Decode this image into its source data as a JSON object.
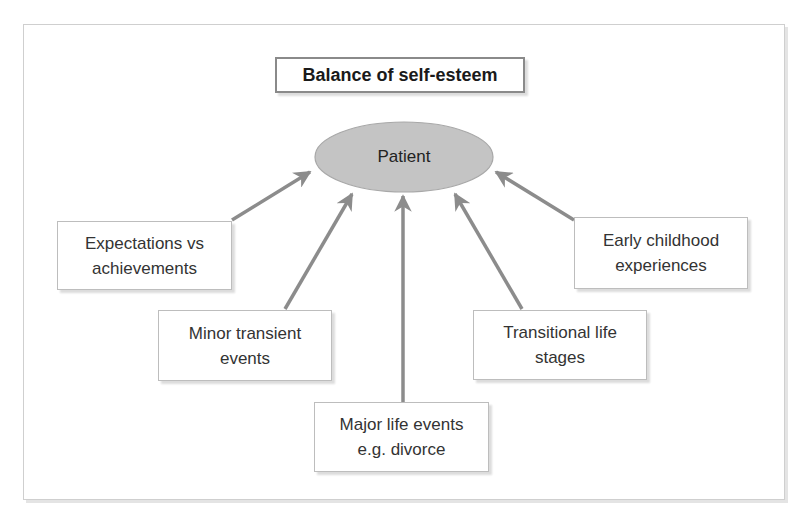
{
  "diagram": {
    "title": "Balance of self-esteem",
    "center": {
      "label": "Patient",
      "fill": "#c4c4c4",
      "stroke": "#9e9e9e"
    },
    "arrow_color": "#8c8c8c",
    "factors": [
      {
        "id": "expectations",
        "label": "Expectations vs\nachievements"
      },
      {
        "id": "minor",
        "label": "Minor transient\nevents"
      },
      {
        "id": "major",
        "label": "Major life events\ne.g. divorce"
      },
      {
        "id": "transitional",
        "label": "Transitional life\nstages"
      },
      {
        "id": "early",
        "label": "Early childhood\nexperiences"
      }
    ]
  }
}
